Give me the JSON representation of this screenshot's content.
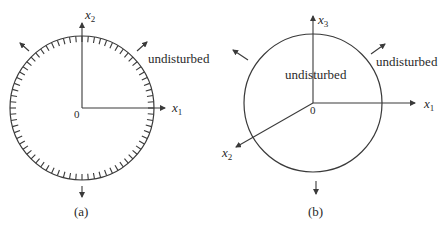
{
  "panels": [
    {
      "id": "a",
      "caption": "(a)",
      "origin_label": "0",
      "axes": [
        {
          "name": "x",
          "sub": "1",
          "direction": "right"
        },
        {
          "name": "x",
          "sub": "2",
          "direction": "up"
        }
      ],
      "region_label": "undisturbed",
      "boundary": "hatched circle",
      "outward_arrows": 3
    },
    {
      "id": "b",
      "caption": "(b)",
      "origin_label": "0",
      "axes": [
        {
          "name": "x",
          "sub": "1",
          "direction": "right"
        },
        {
          "name": "x",
          "sub": "2",
          "direction": "down-left"
        },
        {
          "name": "x",
          "sub": "3",
          "direction": "up"
        }
      ],
      "inner_label": "undisturbed",
      "outer_label": "undisturbed",
      "boundary": "plain circle",
      "outward_arrows": 3
    }
  ],
  "colors": {
    "stroke": "#3a3a3a",
    "text": "#2a2a2a",
    "background": "#ffffff"
  }
}
